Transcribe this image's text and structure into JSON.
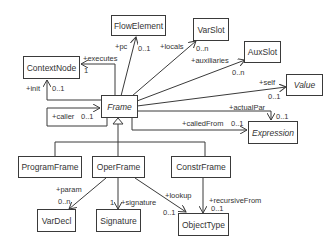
{
  "diagram": {
    "type": "uml-class-diagram",
    "classes": {
      "frame": {
        "name": "Frame",
        "abstract": true
      },
      "flowElement": {
        "name": "FlowElement",
        "abstract": false
      },
      "varSlot": {
        "name": "VarSlot",
        "abstract": false
      },
      "auxSlot": {
        "name": "AuxSlot",
        "abstract": false
      },
      "value": {
        "name": "Value",
        "abstract": true
      },
      "expression": {
        "name": "Expression",
        "abstract": true
      },
      "contextNode": {
        "name": "ContextNode",
        "abstract": false
      },
      "programFrame": {
        "name": "ProgramFrame",
        "abstract": false
      },
      "operFrame": {
        "name": "OperFrame",
        "abstract": false
      },
      "constrFrame": {
        "name": "ConstrFrame",
        "abstract": false
      },
      "varDecl": {
        "name": "VarDecl",
        "abstract": false
      },
      "signature": {
        "name": "Signature",
        "abstract": false
      },
      "objectType": {
        "name": "ObjectType",
        "abstract": false
      }
    },
    "associations": {
      "pc": {
        "from": "Frame",
        "to": "FlowElement",
        "role": "+pc",
        "multiplicity": "0..1"
      },
      "locals": {
        "from": "Frame",
        "to": "VarSlot",
        "role": "+locals",
        "multiplicity": "0..n"
      },
      "auxiliaries": {
        "from": "Frame",
        "to": "AuxSlot",
        "role": "+auxiliaries",
        "multiplicity": "0..n"
      },
      "self": {
        "from": "Frame",
        "to": "Value",
        "role": "+self",
        "multiplicity": "0..1"
      },
      "actualPar": {
        "from": "Frame",
        "to": "Expression",
        "role": "+actualPar",
        "multiplicity": "0..1"
      },
      "calledFrom": {
        "from": "Frame",
        "to": "Expression",
        "role": "+calledFrom",
        "multiplicity": "0..1"
      },
      "executes": {
        "from": "Frame",
        "to": "ContextNode",
        "role": "+executes",
        "multiplicity": "1"
      },
      "init": {
        "from": "Frame",
        "to": "ContextNode",
        "role": "+init",
        "multiplicity": "0..1"
      },
      "caller": {
        "from": "Frame",
        "to": "Frame",
        "role": "+caller",
        "multiplicity": "0..1"
      },
      "param": {
        "from": "OperFrame",
        "to": "VarDecl",
        "role": "+param",
        "multiplicity": "0..n"
      },
      "signature": {
        "from": "OperFrame",
        "to": "Signature",
        "role": "+signature",
        "multiplicity": "1"
      },
      "lookup": {
        "from": "OperFrame",
        "to": "ObjectType",
        "role": "+lookup",
        "multiplicity": "0..1"
      },
      "recursiveFrom": {
        "from": "ConstrFrame",
        "to": "ObjectType",
        "role": "+recursiveFrom",
        "multiplicity": "0..1"
      }
    },
    "generalizations": [
      {
        "child": "ProgramFrame",
        "parent": "Frame"
      },
      {
        "child": "OperFrame",
        "parent": "Frame"
      },
      {
        "child": "ConstrFrame",
        "parent": "Frame"
      }
    ],
    "colors": {
      "line": "#3a3a3a",
      "text": "#333333",
      "background": "#ffffff"
    }
  }
}
